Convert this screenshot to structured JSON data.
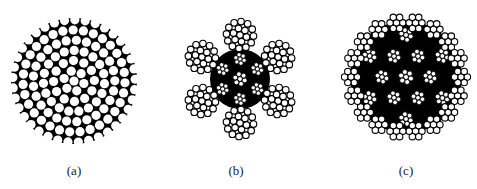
{
  "figures": [
    {
      "id": "a",
      "label": "(a)",
      "description": "Single strand cross-section with densely packed round wires",
      "center": [
        74,
        81
      ],
      "radius": 63,
      "label_pos": [
        74,
        163
      ]
    },
    {
      "id": "b",
      "label": "(b)",
      "description": "6-strand wire rope cross-section with independent wire-rope core",
      "center": [
        240,
        79
      ],
      "radius": 66,
      "label_pos": [
        236,
        163
      ]
    },
    {
      "id": "c",
      "label": "(c)",
      "description": "Multi-strand rotation-resistant wire rope cross-section",
      "center": [
        406,
        77
      ],
      "radius": 64,
      "label_pos": [
        406,
        163
      ]
    }
  ],
  "colors": {
    "background": "#ffffff",
    "wire_fill": "#ffffff",
    "wire_stroke": "#000000",
    "fill_dark": "#000000"
  }
}
